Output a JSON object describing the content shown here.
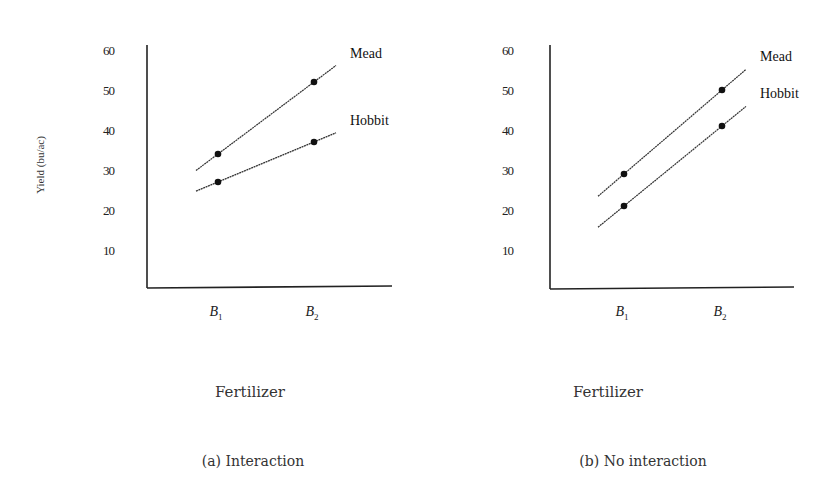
{
  "chart_data": [
    {
      "type": "line",
      "title": "",
      "caption": "(a) Interaction",
      "xlabel": "Fertilizer",
      "ylabel": "Yield (bu/ac)",
      "categories": [
        "B1",
        "B2"
      ],
      "category_labels": [
        {
          "main": "B",
          "sub": "1"
        },
        {
          "main": "B",
          "sub": "2"
        }
      ],
      "yticks": [
        10,
        20,
        30,
        40,
        50,
        60
      ],
      "ylim": [
        0,
        60
      ],
      "grid": false,
      "legend": "inline labels at line ends",
      "series": [
        {
          "name": "Mead",
          "values": [
            34,
            52
          ]
        },
        {
          "name": "Hobbit",
          "values": [
            27,
            37
          ]
        }
      ]
    },
    {
      "type": "line",
      "title": "",
      "caption": "(b) No interaction",
      "xlabel": "Fertilizer",
      "ylabel": "",
      "categories": [
        "B1",
        "B2"
      ],
      "category_labels": [
        {
          "main": "B",
          "sub": "1"
        },
        {
          "main": "B",
          "sub": "2"
        }
      ],
      "yticks": [
        10,
        20,
        30,
        40,
        50,
        60
      ],
      "ylim": [
        0,
        60
      ],
      "grid": false,
      "legend": "inline labels at line ends",
      "series": [
        {
          "name": "Mead",
          "values": [
            29,
            50
          ]
        },
        {
          "name": "Hobbit",
          "values": [
            21,
            41
          ]
        }
      ]
    }
  ],
  "style": {
    "line_color": "#333333",
    "axis_color": "#222222",
    "marker_color": "#111111"
  }
}
